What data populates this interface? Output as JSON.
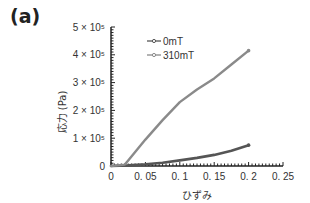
{
  "panel_label": "(a)",
  "chart_data": {
    "type": "line",
    "title": "",
    "xlabel": "ひずみ",
    "ylabel": "応力 (Pa)",
    "xlim": [
      0,
      0.25
    ],
    "ylim": [
      0,
      500000
    ],
    "grid": false,
    "legend_position": "upper-left-inside",
    "x_ticks": [
      "0",
      "0.05",
      "0.1",
      "0.15",
      "0.2",
      "0.25"
    ],
    "y_ticks": [
      "0",
      "1 × 10⁵",
      "2 × 10⁵",
      "3 × 10⁵",
      "4 × 10⁵",
      "5 × 10⁵"
    ],
    "series": [
      {
        "name": "0mT",
        "color": "#555555",
        "x": [
          0,
          0.025,
          0.05,
          0.075,
          0.1,
          0.125,
          0.15,
          0.175,
          0.2
        ],
        "values": [
          0,
          2000,
          6000,
          12000,
          20000,
          29000,
          40000,
          55000,
          75000
        ]
      },
      {
        "name": "310mT",
        "color": "#8a8a8a",
        "x": [
          0,
          0.02,
          0.025,
          0.05,
          0.075,
          0.1,
          0.125,
          0.15,
          0.175,
          0.2
        ],
        "values": [
          0,
          5000,
          20000,
          95000,
          165000,
          230000,
          275000,
          315000,
          365000,
          415000
        ]
      }
    ]
  }
}
